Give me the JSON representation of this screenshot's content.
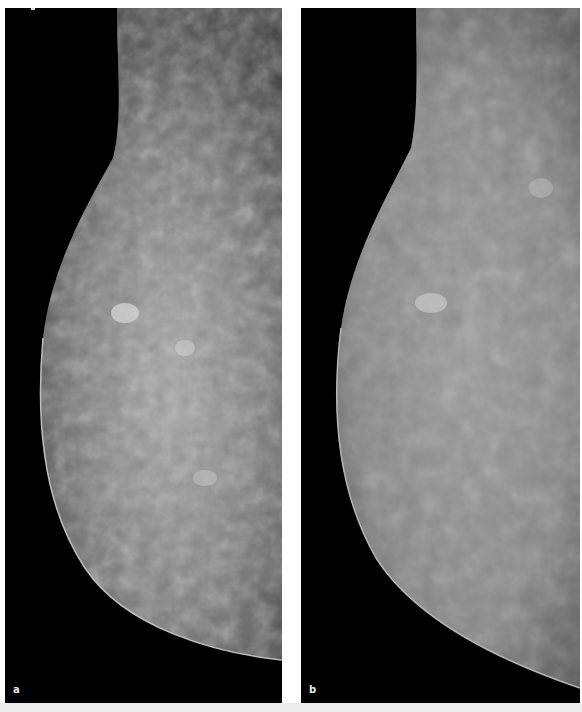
{
  "figure": {
    "panels": [
      {
        "id": "a",
        "label": "a",
        "description": "Mammogram, mediolateral view, dense heterogeneous breast tissue, higher contrast"
      },
      {
        "id": "b",
        "label": "b",
        "description": "Mammogram, same breast, softer/processed contrast rendering"
      }
    ],
    "colors": {
      "background": "#000000",
      "separator": "#ffffff",
      "tissue_light": "#bdbdbd",
      "tissue_dark": "#3a3a3a"
    }
  }
}
